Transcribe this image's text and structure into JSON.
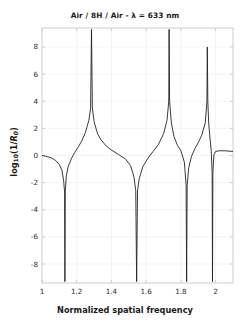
{
  "chart_data": {
    "type": "line",
    "title": "Air / 8H / Air - λ = 633 nm",
    "xlabel": "Normalized spatial frequency",
    "ylabel": "log10(1/R0)",
    "ylabel_parts": {
      "prefix": "log",
      "sub": "10",
      "body": "(1/",
      "ital": "R",
      "ital_sub": "0",
      "suffix": ")"
    },
    "xlim": [
      1,
      2.1
    ],
    "ylim": [
      -9.4,
      9.4
    ],
    "xticks": [
      1,
      1.2,
      1.4,
      1.6,
      1.8,
      2
    ],
    "xtick_labels": [
      "1",
      "1.2",
      "1.4",
      "1.6",
      "1.8",
      "2"
    ],
    "yticks": [
      -8,
      -6,
      -4,
      -2,
      0,
      2,
      4,
      6,
      8
    ],
    "ytick_labels": [
      "-8",
      "-6",
      "-4",
      "-2",
      "0",
      "2",
      "4",
      "6",
      "8"
    ],
    "grid": true,
    "legend": null,
    "line_color": "#222222",
    "line_width": 0.9,
    "series": [
      {
        "name": "log10(1/R0)",
        "comment": "Resonant reflectance of an 8-period high-index layer stack; poles (transmission resonances, log10(1/R0) -> +inf) and zeros (R0 -> 1, log10 -> -inf).",
        "poles": [
          1.285,
          1.732,
          1.952
        ],
        "zeros": [
          1.132,
          1.545,
          1.833,
          1.982
        ],
        "baseline_start": 0.0,
        "x": [
          1.0,
          1.02,
          1.04,
          1.06,
          1.08,
          1.1,
          1.115,
          1.125,
          1.13,
          1.132,
          1.134,
          1.14,
          1.15,
          1.17,
          1.19,
          1.21,
          1.23,
          1.25,
          1.27,
          1.28,
          1.285,
          1.29,
          1.3,
          1.32,
          1.34,
          1.37,
          1.4,
          1.44,
          1.48,
          1.51,
          1.53,
          1.54,
          1.545,
          1.55,
          1.56,
          1.58,
          1.61,
          1.64,
          1.67,
          1.7,
          1.72,
          1.73,
          1.732,
          1.735,
          1.745,
          1.76,
          1.78,
          1.8,
          1.82,
          1.83,
          1.833,
          1.836,
          1.845,
          1.86,
          1.88,
          1.9,
          1.92,
          1.94,
          1.95,
          1.952,
          1.955,
          1.96,
          1.968,
          1.975,
          1.98,
          1.982,
          1.984,
          1.99,
          2.0,
          2.02,
          2.05,
          2.1
        ],
        "y": [
          0.0,
          -0.05,
          -0.12,
          -0.22,
          -0.38,
          -0.68,
          -1.1,
          -1.9,
          -2.7,
          -9.3,
          -2.7,
          -1.5,
          -0.85,
          -0.2,
          0.25,
          0.65,
          1.1,
          1.7,
          2.6,
          3.5,
          9.3,
          3.5,
          2.5,
          1.6,
          1.15,
          0.7,
          0.4,
          0.08,
          -0.25,
          -0.75,
          -1.6,
          -2.6,
          -9.3,
          -2.6,
          -1.7,
          -0.85,
          -0.2,
          0.3,
          0.8,
          1.6,
          2.6,
          4.0,
          9.3,
          4.0,
          2.4,
          1.4,
          0.75,
          0.35,
          -0.5,
          -2.2,
          -9.3,
          -2.2,
          -0.9,
          -0.1,
          0.5,
          0.95,
          1.5,
          2.4,
          4.0,
          8.0,
          4.0,
          2.4,
          1.2,
          0.3,
          -1.3,
          -9.3,
          -1.3,
          0.05,
          0.3,
          0.35,
          0.35,
          0.3
        ]
      }
    ]
  },
  "plot_geometry": {
    "left": 42,
    "right": 233,
    "top": 28,
    "bottom": 283,
    "axis_color": "#c8c8c8",
    "grid_color": "#eeeeee",
    "bg": "#ffffff"
  }
}
